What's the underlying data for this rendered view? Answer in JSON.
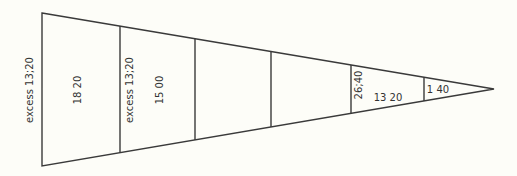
{
  "diagram": {
    "shape": "tapering-wedge",
    "colors": {
      "background": "#fdfdf8",
      "stroke": "#3a3a3a",
      "text": "#333333"
    },
    "labels": {
      "outer_left": "excess 13;20",
      "seg1": "18 20",
      "seg2_left": "excess 13;20",
      "seg2": "15 00",
      "seg5_left": "26;40",
      "seg5": "13 20",
      "seg6": "1 40"
    }
  }
}
